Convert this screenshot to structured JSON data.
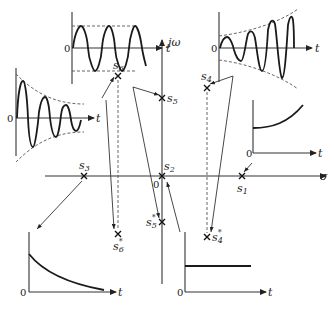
{
  "diagram": {
    "type": "s-plane pole locations with corresponding time responses",
    "axes": {
      "real_label": "σ",
      "imag_label": "jω",
      "origin_label": "0"
    },
    "poles": [
      {
        "id": "s1",
        "label": "s",
        "sub": "1",
        "conj": false,
        "x": 242,
        "y": 176,
        "response": "exponential-growth"
      },
      {
        "id": "s2",
        "label": "s",
        "sub": "2",
        "conj": false,
        "x": 162,
        "y": 176,
        "response": "constant-step"
      },
      {
        "id": "s3",
        "label": "s",
        "sub": "3",
        "conj": false,
        "x": 84,
        "y": 176,
        "response": "exponential-decay"
      },
      {
        "id": "s4",
        "label": "s",
        "sub": "4",
        "conj": false,
        "x": 207,
        "y": 88,
        "response": "growing-oscillation"
      },
      {
        "id": "s4c",
        "label": "s",
        "sub": "4",
        "conj": true,
        "x": 207,
        "y": 237,
        "response": "growing-oscillation"
      },
      {
        "id": "s5",
        "label": "s",
        "sub": "5",
        "conj": false,
        "x": 162,
        "y": 98,
        "response": "sustained-oscillation"
      },
      {
        "id": "s5c",
        "label": "s",
        "sub": "5",
        "conj": true,
        "x": 162,
        "y": 222,
        "response": "sustained-oscillation"
      },
      {
        "id": "s6",
        "label": "s",
        "sub": "6",
        "conj": false,
        "x": 118,
        "y": 76,
        "response": "decaying-oscillation"
      },
      {
        "id": "s6c",
        "label": "s",
        "sub": "6",
        "conj": true,
        "x": 118,
        "y": 234,
        "response": "decaying-oscillation"
      }
    ],
    "time_plots": [
      {
        "id": "sustained-oscillation",
        "t_label": "t",
        "zero_label": "0"
      },
      {
        "id": "growing-oscillation",
        "t_label": "t",
        "zero_label": "0"
      },
      {
        "id": "decaying-oscillation",
        "t_label": "t",
        "zero_label": "0"
      },
      {
        "id": "exponential-growth",
        "t_label": "t",
        "zero_label": "0"
      },
      {
        "id": "exponential-decay",
        "t_label": "t",
        "zero_label": "0"
      },
      {
        "id": "constant-step",
        "t_label": "t",
        "zero_label": "0"
      }
    ],
    "conj_mark": "*"
  }
}
